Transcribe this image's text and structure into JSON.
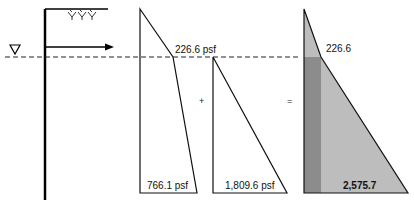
{
  "diagram": {
    "water_table_symbol": "∇",
    "operators": {
      "plus": "+",
      "equals": "="
    },
    "diagram_1": {
      "top_label": "226.6 psf",
      "bottom_label": "766.1 psf"
    },
    "diagram_2": {
      "bottom_label": "1,809.6 psf"
    },
    "diagram_3": {
      "top_label": "226.6",
      "bottom_label": "2,575.7"
    },
    "colors": {
      "line": "#111111",
      "light_fill": "#b8b8b8",
      "dark_fill": "#8a8a8a",
      "wall": "#000000"
    }
  }
}
